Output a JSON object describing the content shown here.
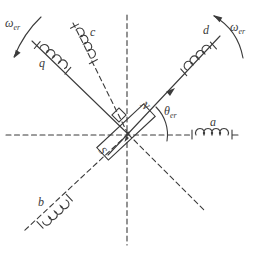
{
  "figure": {
    "background_color": "#ffffff",
    "ink_color": "#3b3b3b"
  },
  "labels": {
    "omega_top_left": {
      "base": "ω",
      "sub": "er"
    },
    "omega_top_right": {
      "base": "ω",
      "sub": "er"
    },
    "theta": {
      "base": "θ",
      "sub": "er"
    }
  },
  "axes": {
    "phase_a": "a",
    "phase_b": "b",
    "phase_c": "c",
    "d_axis": "d",
    "q_axis": "q"
  },
  "rotor": {
    "north_pole": "N",
    "south_pole": "S"
  },
  "icons": {
    "rotation_arrow_left": "curved-ccw-arrow",
    "rotation_arrow_right": "curved-ccw-arrow",
    "coil_symbol": "inductor-loops"
  }
}
